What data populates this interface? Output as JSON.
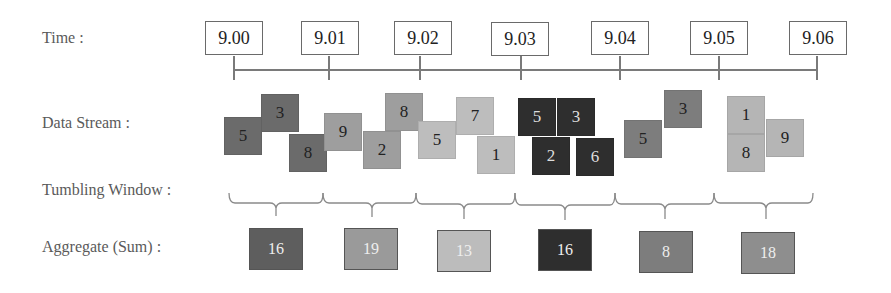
{
  "labels": {
    "time": "Time :",
    "data_stream": "Data Stream :",
    "tumbling_window": "Tumbling Window :",
    "aggregate": "Aggregate (Sum) :"
  },
  "times": [
    "9.00",
    "9.01",
    "9.02",
    "9.03",
    "9.04",
    "9.05",
    "9.06"
  ],
  "colors": {
    "w1": "#6b6b6b",
    "w2": "#9e9e9e",
    "w3": "#bdbdbd",
    "w4": "#2e2e2e",
    "w5": "#7d7d7d",
    "w6": "#b5b5b5"
  },
  "windows": [
    {
      "start": "9.00",
      "end": "9.01",
      "values": [
        "5",
        "3",
        "8"
      ],
      "sum": "16"
    },
    {
      "start": "9.01",
      "end": "9.02",
      "values": [
        "9",
        "2",
        "8"
      ],
      "sum": "19"
    },
    {
      "start": "9.02",
      "end": "9.03",
      "values": [
        "5",
        "7",
        "1"
      ],
      "sum": "13"
    },
    {
      "start": "9.03",
      "end": "9.04",
      "values": [
        "5",
        "3",
        "2",
        "6"
      ],
      "sum": "16"
    },
    {
      "start": "9.04",
      "end": "9.05",
      "values": [
        "5",
        "3"
      ],
      "sum": "8"
    },
    {
      "start": "9.05",
      "end": "9.06",
      "values": [
        "1",
        "8",
        "9"
      ],
      "sum": "18"
    }
  ]
}
